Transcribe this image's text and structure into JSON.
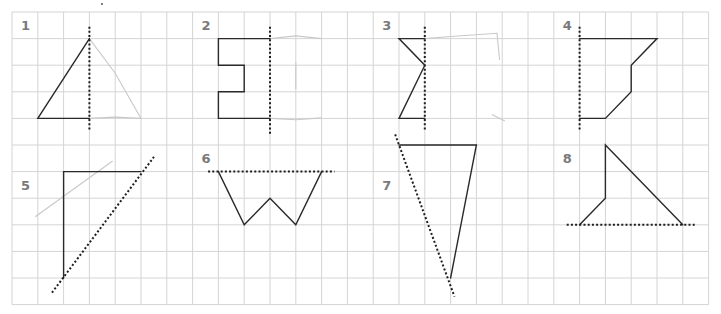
{
  "worksheet": {
    "title": "Reflection grid exercises",
    "colors": {
      "grid": "#d4d4d4",
      "shape": "#2a2a2a",
      "mirror": "#1e1e1e",
      "faint": "#c9c9c9",
      "label": "#7a7a7a"
    },
    "grid": {
      "x0": 12,
      "y0": 12,
      "dx": 25.8,
      "dy": 26.6,
      "cols": 27,
      "rows": 11
    },
    "exercises": [
      {
        "label": "1",
        "label_cell": [
          0,
          0
        ],
        "shape": [
          [
            [
              3,
              1
            ],
            [
              1,
              4
            ],
            [
              3,
              4
            ]
          ]
        ],
        "mirror": [
          [
            3,
            0.55
          ],
          [
            3,
            4.5
          ]
        ],
        "faint": [
          [
            [
              3,
              1
            ],
            [
              4,
              2.3
            ],
            [
              5,
              4
            ],
            [
              4,
              3.95
            ],
            [
              3,
              4
            ]
          ]
        ]
      },
      {
        "label": "2",
        "label_cell": [
          7,
          0
        ],
        "shape": [
          [
            [
              10,
              1
            ],
            [
              8,
              1
            ],
            [
              8,
              2
            ],
            [
              9,
              2
            ],
            [
              9,
              3
            ],
            [
              8,
              3
            ],
            [
              8,
              4
            ],
            [
              10,
              4
            ]
          ]
        ],
        "mirror": [
          [
            10,
            0.55
          ],
          [
            10,
            4.6
          ]
        ],
        "faint": [
          [
            [
              10,
              1
            ],
            [
              11,
              0.9
            ],
            [
              12,
              1
            ]
          ],
          [
            [
              10,
              4
            ],
            [
              11,
              4.05
            ],
            [
              12,
              3.98
            ]
          ],
          [
            [
              11,
              1.9
            ],
            [
              11,
              2.9
            ]
          ]
        ]
      },
      {
        "label": "3",
        "label_cell": [
          14,
          0
        ],
        "shape": [
          [
            [
              16,
              1
            ],
            [
              15,
              1
            ],
            [
              16,
              2
            ],
            [
              15,
              4
            ],
            [
              16,
              4
            ]
          ]
        ],
        "mirror": [
          [
            16,
            0.55
          ],
          [
            16,
            4.5
          ]
        ],
        "faint": [
          [
            [
              16,
              1
            ],
            [
              17,
              0.92
            ],
            [
              18.8,
              0.8
            ],
            [
              18.9,
              1.8
            ]
          ],
          [
            [
              18.6,
              3.85
            ],
            [
              19.1,
              4.1
            ]
          ]
        ]
      },
      {
        "label": "4",
        "label_cell": [
          21,
          0
        ],
        "shape": [
          [
            [
              22,
              1
            ],
            [
              25,
              1
            ],
            [
              24,
              2
            ],
            [
              24,
              3
            ],
            [
              23,
              4
            ],
            [
              22,
              4
            ]
          ]
        ],
        "mirror": [
          [
            22,
            0.55
          ],
          [
            22,
            4.5
          ]
        ],
        "faint": []
      },
      {
        "label": "5",
        "label_cell": [
          0,
          6
        ],
        "shape": [
          [
            [
              5,
              6
            ],
            [
              2,
              6
            ],
            [
              2,
              10
            ]
          ]
        ],
        "mirror": [
          [
            1.55,
            10.55
          ],
          [
            5.5,
            5.45
          ]
        ],
        "faint": [
          [
            [
              0.9,
              7.7
            ],
            [
              3.9,
              5.6
            ]
          ]
        ]
      },
      {
        "label": "6",
        "label_cell": [
          7,
          5
        ],
        "shape": [
          [
            [
              8,
              6
            ],
            [
              9,
              8
            ],
            [
              10,
              7
            ],
            [
              11,
              8
            ],
            [
              12,
              6
            ]
          ]
        ],
        "mirror": [
          [
            7.6,
            6
          ],
          [
            12.5,
            6
          ]
        ],
        "faint": []
      },
      {
        "label": "7",
        "label_cell": [
          14,
          6
        ],
        "shape": [
          [
            [
              15,
              5
            ],
            [
              18,
              5
            ],
            [
              17,
              10
            ]
          ]
        ],
        "mirror": [
          [
            14.85,
            4.6
          ],
          [
            17.15,
            10.7
          ]
        ],
        "faint": []
      },
      {
        "label": "8",
        "label_cell": [
          21,
          5
        ],
        "shape": [
          [
            [
              22,
              8
            ],
            [
              23,
              7
            ],
            [
              23,
              5
            ],
            [
              26,
              8
            ]
          ]
        ],
        "mirror": [
          [
            21.5,
            8
          ],
          [
            26.5,
            8
          ]
        ],
        "faint": []
      }
    ],
    "stray_marks": [
      [
        102,
        4
      ]
    ]
  }
}
